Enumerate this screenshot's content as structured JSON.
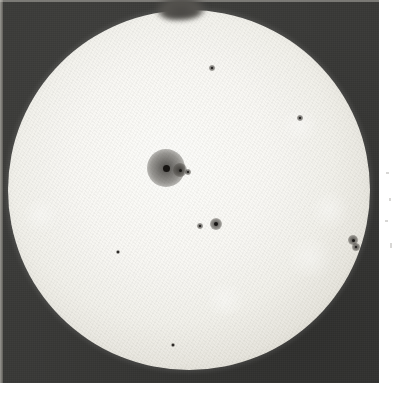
{
  "image": {
    "kind": "astronomical-photograph",
    "subject": "Sun",
    "caption": "Photograph of the solar disk showing sunspots",
    "medium": "black-and-white photographic plate",
    "background_color": "#3a3a38",
    "disk_color": "#f7f6f2",
    "margin_color": "#ffffff"
  },
  "plate": {
    "label": "photographic-plate",
    "width_px": 379,
    "height_px": 383
  },
  "disk": {
    "label": "solar-disk",
    "center_x": 189,
    "center_y": 190,
    "radius_px": 181
  },
  "features": {
    "top_blob_label": "dark-edge-blob",
    "main_group_label": "main-sunspot-group",
    "faculae_label": "faculae-patch",
    "spot_label": "sunspot"
  },
  "sunspots": [
    {
      "name": "main-sunspot-group",
      "x": 166,
      "y": 168,
      "penumbra_px": 19,
      "umbra_px": 7
    },
    {
      "name": "companion-spot",
      "x": 180,
      "y": 170,
      "penumbra_px": 7,
      "umbra_px": 3
    },
    {
      "name": "satellite-speck",
      "x": 188,
      "y": 172,
      "penumbra_px": 3,
      "umbra_px": 2
    },
    {
      "name": "mid-disk-spot",
      "x": 216,
      "y": 224,
      "penumbra_px": 6,
      "umbra_px": 4
    },
    {
      "name": "mid-disk-speck",
      "x": 200,
      "y": 226,
      "penumbra_px": 3,
      "umbra_px": 2
    },
    {
      "name": "upper-disk-speck",
      "x": 212,
      "y": 68,
      "penumbra_px": 3,
      "umbra_px": 2
    },
    {
      "name": "limb-spot-pair",
      "x": 353,
      "y": 240,
      "penumbra_px": 5,
      "umbra_px": 3
    },
    {
      "name": "limb-speck",
      "x": 356,
      "y": 247,
      "penumbra_px": 4,
      "umbra_px": 2
    },
    {
      "name": "low-left-speck",
      "x": 118,
      "y": 252,
      "penumbra_px": 2,
      "umbra_px": 2
    },
    {
      "name": "low-disk-speck",
      "x": 173,
      "y": 345,
      "penumbra_px": 2,
      "umbra_px": 2
    },
    {
      "name": "upper-right-speck",
      "x": 300,
      "y": 118,
      "penumbra_px": 3,
      "umbra_px": 2
    }
  ],
  "faculae": [
    {
      "name": "faculae-lower-right",
      "x": 310,
      "y": 258,
      "w": 56,
      "h": 38
    },
    {
      "name": "faculae-right-limb",
      "x": 330,
      "y": 210,
      "w": 38,
      "h": 44
    },
    {
      "name": "faculae-lower-center",
      "x": 225,
      "y": 300,
      "w": 50,
      "h": 30
    },
    {
      "name": "faculae-upper-right",
      "x": 300,
      "y": 125,
      "w": 44,
      "h": 30
    },
    {
      "name": "faculae-left-limb",
      "x": 40,
      "y": 215,
      "w": 34,
      "h": 40
    }
  ],
  "margin_marks": [
    {
      "name": "margin-speck-1",
      "x": 386,
      "y": 172,
      "w": 3,
      "h": 2
    },
    {
      "name": "margin-speck-2",
      "x": 389,
      "y": 198,
      "w": 2,
      "h": 3
    },
    {
      "name": "margin-speck-3",
      "x": 385,
      "y": 220,
      "w": 3,
      "h": 2
    },
    {
      "name": "margin-speck-4",
      "x": 390,
      "y": 243,
      "w": 2,
      "h": 5
    }
  ]
}
